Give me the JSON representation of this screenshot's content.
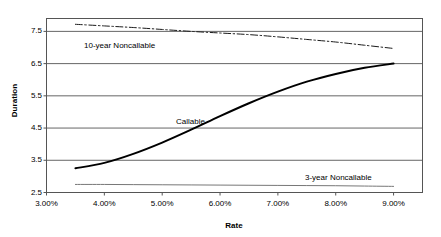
{
  "chart_data": {
    "type": "line",
    "title": "",
    "xlabel": "Rate",
    "ylabel": "Duration",
    "xlim": [
      3.0,
      9.5
    ],
    "ylim": [
      2.5,
      7.9
    ],
    "grid": true,
    "legend_position": "inline-annotations",
    "x_tick_labels": [
      "3.00%",
      "4.00%",
      "5.00%",
      "6.00%",
      "7.00%",
      "8.00%",
      "9.00%"
    ],
    "x_ticks": [
      3.0,
      4.0,
      5.0,
      6.0,
      7.0,
      8.0,
      9.0
    ],
    "y_tick_labels": [
      "2.5",
      "3.5",
      "4.5",
      "5.5",
      "6.5",
      "7.5"
    ],
    "y_ticks": [
      2.5,
      3.5,
      4.5,
      5.5,
      6.5,
      7.5
    ],
    "x": [
      3.5,
      4.0,
      4.5,
      5.0,
      5.5,
      6.0,
      6.5,
      7.0,
      7.5,
      8.0,
      8.5,
      9.0
    ],
    "series": [
      {
        "name": "10-year Noncallable",
        "style": "dash-dot",
        "color": "#1a1a1a",
        "width": 1.0,
        "values": [
          7.72,
          7.67,
          7.62,
          7.56,
          7.5,
          7.45,
          7.4,
          7.33,
          7.25,
          7.17,
          7.07,
          6.97
        ]
      },
      {
        "name": "Callable",
        "style": "solid",
        "color": "#000000",
        "width": 2.0,
        "values": [
          3.25,
          3.42,
          3.7,
          4.05,
          4.45,
          4.87,
          5.27,
          5.63,
          5.94,
          6.18,
          6.37,
          6.5
        ]
      },
      {
        "name": "3-year Noncallable",
        "style": "solid",
        "color": "#777777",
        "width": 1.0,
        "values": [
          2.75,
          2.75,
          2.745,
          2.74,
          2.735,
          2.73,
          2.725,
          2.72,
          2.715,
          2.71,
          2.7,
          2.69
        ]
      }
    ],
    "annotations": [
      {
        "text": "10-year Noncallable",
        "x_px": 84,
        "y_px": 41
      },
      {
        "text": "Callable",
        "x_px": 176,
        "y_px": 117
      },
      {
        "text": "3-year Noncallable",
        "x_px": 305,
        "y_px": 173
      }
    ]
  }
}
